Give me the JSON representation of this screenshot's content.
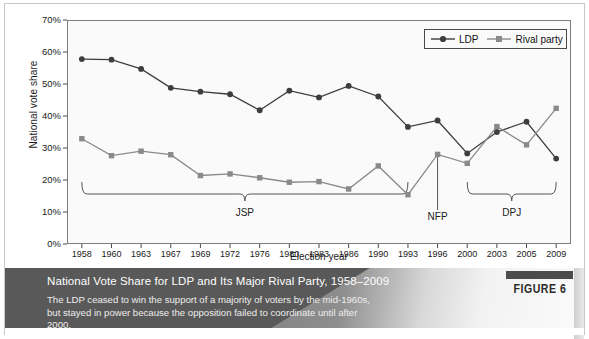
{
  "figure": {
    "tag": "FIGURE 6",
    "caption_title": "National Vote Share for LDP and Its Major Rival Party, 1958–2009",
    "caption_body": "The LDP ceased to win the support of a majority of voters by the mid-1960s, but stayed in power because the opposition failed to coordinate until after 2000."
  },
  "legend": {
    "series1": "LDP",
    "series2": "Rival party"
  },
  "annotations": [
    {
      "name": "jsp",
      "label": "JSP",
      "start_year": "1958",
      "end_year": "1993"
    },
    {
      "name": "nfp",
      "label": "NFP",
      "year": "1996"
    },
    {
      "name": "dpj",
      "label": "DPJ",
      "start_year": "2000",
      "end_year": "2009"
    }
  ],
  "chart_data": {
    "type": "line",
    "title": "National Vote Share for LDP and Its Major Rival Party, 1958–2009",
    "xlabel": "Election year",
    "ylabel": "National vote share",
    "categories": [
      "1958",
      "1960",
      "1963",
      "1967",
      "1969",
      "1972",
      "1976",
      "1980",
      "1983",
      "1986",
      "1990",
      "1993",
      "1996",
      "2000",
      "2003",
      "2005",
      "2009"
    ],
    "ytick_labels": [
      "0%",
      "10%",
      "20%",
      "30%",
      "40%",
      "50%",
      "60%",
      "70%"
    ],
    "ytick_values": [
      0,
      10,
      20,
      30,
      40,
      50,
      60,
      70
    ],
    "ylim": [
      0,
      70
    ],
    "grid": false,
    "legend_position": "top-right",
    "series": [
      {
        "name": "LDP",
        "color": "#3d3d3d",
        "marker": "circle",
        "values": [
          57.8,
          57.6,
          54.7,
          48.8,
          47.6,
          46.8,
          41.8,
          47.9,
          45.8,
          49.4,
          46.1,
          36.6,
          38.6,
          28.3,
          35.0,
          38.2,
          26.7
        ]
      },
      {
        "name": "Rival party",
        "color": "#8a8a8a",
        "marker": "square",
        "values": [
          32.9,
          27.6,
          29.0,
          27.9,
          21.4,
          21.9,
          20.7,
          19.3,
          19.5,
          17.2,
          24.4,
          15.4,
          28.0,
          25.2,
          36.7,
          31.0,
          42.4
        ]
      }
    ]
  }
}
